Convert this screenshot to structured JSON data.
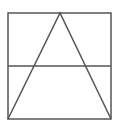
{
  "diagram": {
    "stroke_color": "#555555",
    "background": "#ffffff",
    "square": {
      "x": 8,
      "y": 13,
      "width": 103,
      "height": 106
    },
    "triangle": {
      "apex": [
        60,
        13
      ],
      "base_left": [
        8,
        119
      ],
      "base_right": [
        111,
        119
      ]
    },
    "horizontal_line": {
      "y": 66,
      "x1": 8,
      "x2": 111
    }
  }
}
